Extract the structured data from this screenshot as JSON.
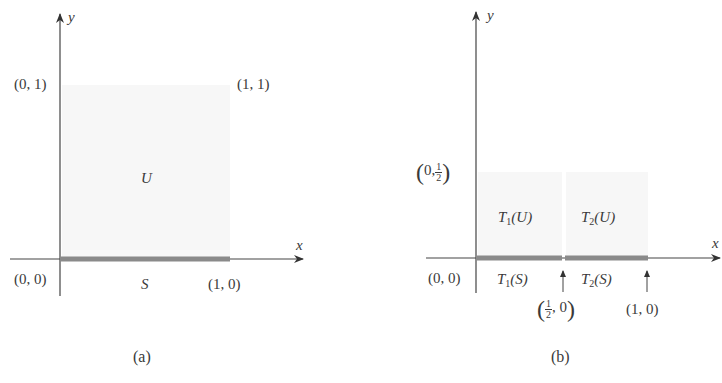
{
  "figure_a": {
    "caption": "(a)",
    "axis_x_label": "x",
    "axis_y_label": "y",
    "region_label": "U",
    "segment_label": "S",
    "points": {
      "origin": "(0, 0)",
      "top_left": "(0, 1)",
      "top_right": "(1, 1)",
      "bottom_right": "(1, 0)"
    }
  },
  "figure_b": {
    "caption": "(b)",
    "axis_x_label": "x",
    "axis_y_label": "y",
    "region_labels": {
      "t1_u": {
        "T": "T",
        "sub": "1",
        "arg": "(U)"
      },
      "t2_u": {
        "T": "T",
        "sub": "2",
        "arg": "(U)"
      }
    },
    "segment_labels": {
      "t1_s": {
        "T": "T",
        "sub": "1",
        "arg": "(S)"
      },
      "t2_s": {
        "T": "T",
        "sub": "2",
        "arg": "(S)"
      }
    },
    "points": {
      "origin": "(0, 0)",
      "half_y": {
        "open": "(",
        "pre": "0,",
        "num": "1",
        "den": "2",
        "close": ")"
      },
      "half_x": {
        "open": "(",
        "num": "1",
        "den": "2",
        "post": ", 0",
        "close": ")"
      },
      "one_x": "(1, 0)"
    }
  },
  "colors": {
    "axis": "#444444",
    "segment": "#8a8a8a",
    "region_fill": "#f7f7f7"
  }
}
